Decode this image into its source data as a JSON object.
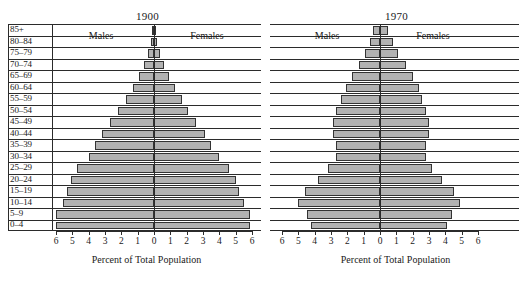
{
  "figure": {
    "background": "#ffffff",
    "bar_fill": "#b2b2b2",
    "bar_stroke": "#333333",
    "axis_color": "#2b2b2b"
  },
  "panels": [
    {
      "id": "panel-1900",
      "title": "1900",
      "left_legend": "Males",
      "right_legend": "Females",
      "axis_title": "Percent of Total Population",
      "show_age_labels": true
    },
    {
      "id": "panel-1970",
      "title": "1970",
      "left_legend": "Males",
      "right_legend": "Females",
      "axis_title": "Percent of Total Population",
      "show_age_labels": false
    }
  ],
  "age_groups": [
    "85+",
    "80–84",
    "75–79",
    "70–74",
    "65–69",
    "60–64",
    "55–59",
    "50–54",
    "45–49",
    "40–44",
    "35–39",
    "30–34",
    "25–29",
    "20–24",
    "15–19",
    "10–14",
    "5–9",
    "0–4"
  ],
  "tick_labels": [
    "6",
    "5",
    "4",
    "3",
    "2",
    "1",
    "0",
    "1",
    "2",
    "3",
    "4",
    "5",
    "6"
  ],
  "chart_data": [
    {
      "type": "bar",
      "title": "1900",
      "subtitle": "Population pyramid, percent of total population by age and sex",
      "xlabel": "Percent of Total Population",
      "ylabel": "",
      "xlim": [
        -6,
        6
      ],
      "xticks": [
        -6,
        -5,
        -4,
        -3,
        -2,
        -1,
        0,
        1,
        2,
        3,
        4,
        5,
        6
      ],
      "xticklabels": [
        "6",
        "5",
        "4",
        "3",
        "2",
        "1",
        "0",
        "1",
        "2",
        "3",
        "4",
        "5",
        "6"
      ],
      "grid": true,
      "legend_position": "inside-top",
      "categories": [
        "85+",
        "80–84",
        "75–79",
        "70–74",
        "65–69",
        "60–64",
        "55–59",
        "50–54",
        "45–49",
        "40–44",
        "35–39",
        "30–34",
        "25–29",
        "20–24",
        "15–19",
        "10–14",
        "5–9",
        "0–4"
      ],
      "series": [
        {
          "name": "Males",
          "side": "left",
          "values": [
            0.1,
            0.2,
            0.35,
            0.6,
            0.9,
            1.3,
            1.7,
            2.2,
            2.7,
            3.2,
            3.6,
            4.0,
            4.7,
            5.1,
            5.3,
            5.6,
            6.0,
            6.0
          ]
        },
        {
          "name": "Females",
          "side": "right",
          "values": [
            0.1,
            0.2,
            0.35,
            0.6,
            0.9,
            1.3,
            1.7,
            2.1,
            2.6,
            3.1,
            3.5,
            4.0,
            4.6,
            5.0,
            5.2,
            5.5,
            5.9,
            5.9
          ]
        }
      ]
    },
    {
      "type": "bar",
      "title": "1970",
      "subtitle": "Population pyramid, percent of total population by age and sex",
      "xlabel": "Percent of Total Population",
      "ylabel": "",
      "xlim": [
        -6,
        6
      ],
      "xticks": [
        -6,
        -5,
        -4,
        -3,
        -2,
        -1,
        0,
        1,
        2,
        3,
        4,
        5,
        6
      ],
      "xticklabels": [
        "6",
        "5",
        "4",
        "3",
        "2",
        "1",
        "0",
        "1",
        "2",
        "3",
        "4",
        "5",
        "6"
      ],
      "grid": true,
      "legend_position": "inside-top",
      "categories": [
        "85+",
        "80–84",
        "75–79",
        "70–74",
        "65–69",
        "60–64",
        "55–59",
        "50–54",
        "45–49",
        "40–44",
        "35–39",
        "30–34",
        "25–29",
        "20–24",
        "15–19",
        "10–14",
        "5–9",
        "0–4"
      ],
      "series": [
        {
          "name": "Males",
          "side": "left",
          "values": [
            0.4,
            0.6,
            0.9,
            1.3,
            1.7,
            2.1,
            2.4,
            2.7,
            2.9,
            2.9,
            2.7,
            2.7,
            3.2,
            3.8,
            4.6,
            5.0,
            4.5,
            4.2
          ]
        },
        {
          "name": "Females",
          "side": "right",
          "values": [
            0.5,
            0.8,
            1.1,
            1.6,
            2.0,
            2.4,
            2.6,
            2.8,
            3.0,
            3.0,
            2.8,
            2.8,
            3.2,
            3.8,
            4.5,
            4.9,
            4.4,
            4.1
          ]
        }
      ]
    }
  ]
}
